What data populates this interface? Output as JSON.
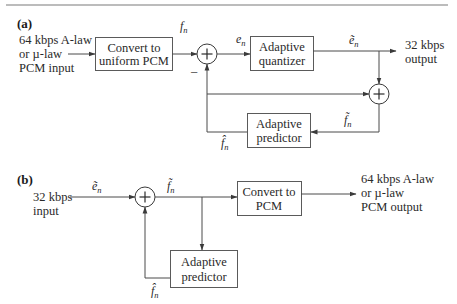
{
  "diagram": {
    "panel_a": {
      "label": "(a)",
      "input_label": [
        "64 kbps A-law",
        "or µ-law",
        "PCM input"
      ],
      "blocks": {
        "convert": [
          "Convert to",
          "uniform PCM"
        ],
        "quantizer": [
          "Adaptive",
          "quantizer"
        ],
        "predictor": [
          "Adaptive",
          "predictor"
        ]
      },
      "signals": {
        "f_n": {
          "base": "f",
          "sub": "n"
        },
        "e_n": {
          "base": "e",
          "sub": "n"
        },
        "e_tilde_n": {
          "base": "ẽ",
          "sub": "n"
        },
        "f_tilde_n": {
          "base": "f̃",
          "sub": "n"
        },
        "f_hat_n": {
          "base": "f̂",
          "sub": "n"
        }
      },
      "minus_sign": "–",
      "output_label": [
        "32 kbps",
        "output"
      ],
      "summers": [
        "+",
        "+"
      ]
    },
    "panel_b": {
      "label": "(b)",
      "input_label": [
        "32 kbps",
        "input"
      ],
      "blocks": {
        "convert": [
          "Convert to",
          "PCM"
        ],
        "predictor": [
          "Adaptive",
          "predictor"
        ]
      },
      "signals": {
        "e_tilde_n": {
          "base": "ẽ",
          "sub": "n"
        },
        "f_tilde_n": {
          "base": "f̃",
          "sub": "n"
        },
        "f_hat_n": {
          "base": "f̂",
          "sub": "n"
        }
      },
      "output_label": [
        "64 kbps A-law",
        "or µ-law",
        "PCM output"
      ],
      "summers": [
        "+"
      ]
    }
  },
  "colors": {
    "line": "#4a4a4a",
    "text": "#2a2a2a",
    "background": "#ffffff"
  }
}
